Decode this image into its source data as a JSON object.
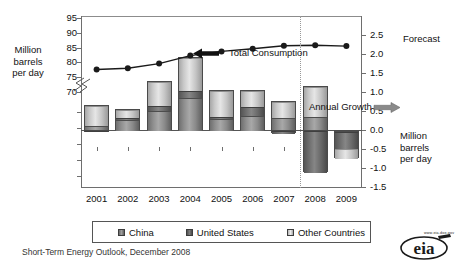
{
  "chart_data": {
    "type": "bar",
    "title": "",
    "subtitle": "",
    "categories": [
      "2001",
      "2002",
      "2003",
      "2004",
      "2005",
      "2006",
      "2007",
      "2008",
      "2009"
    ],
    "xlabel": "",
    "left_axis": {
      "label_lines": [
        "Million",
        "barrels",
        "per day"
      ],
      "ticks": [
        "70",
        "75",
        "80",
        "85",
        "90",
        "95"
      ],
      "ylim": [
        70,
        95
      ],
      "has_break": true
    },
    "right_axis": {
      "label_lines": [
        "Million",
        "barrels",
        "per day"
      ],
      "ticks": [
        "2.5",
        "2.0",
        "1.5",
        "1.0",
        "0.5",
        "0.0",
        "-0.5",
        "-1.0",
        "-1.5"
      ],
      "ylim": [
        -1.5,
        2.5
      ]
    },
    "series": [
      {
        "name": "China",
        "type": "bar-segment",
        "axis": "right",
        "values": [
          0.12,
          0.28,
          0.52,
          0.86,
          0.32,
          0.4,
          0.34,
          0.38,
          -0.03
        ]
      },
      {
        "name": "United States",
        "type": "bar-segment",
        "axis": "right",
        "values": [
          -0.02,
          0.05,
          0.14,
          0.18,
          0.06,
          0.22,
          -0.08,
          -1.1,
          -0.45
        ]
      },
      {
        "name": "Other Countries",
        "type": "bar-segment",
        "axis": "right",
        "values": [
          0.55,
          0.22,
          0.62,
          0.88,
          0.68,
          0.42,
          0.42,
          0.78,
          -0.25
        ]
      },
      {
        "name": "Total Consumption",
        "type": "line",
        "axis": "left",
        "values": [
          77.6,
          78.0,
          79.6,
          82.3,
          83.7,
          84.6,
          85.6,
          85.8,
          85.5
        ]
      }
    ],
    "annotations": [
      {
        "name": "total-consumption",
        "text": "Total Consumption",
        "arrow": "left"
      },
      {
        "name": "annual-growth",
        "text": "Annual Growth",
        "arrow": "right"
      },
      {
        "name": "forecast",
        "text": "Forecast",
        "arrow": "none",
        "divider_after_category": "2007"
      }
    ],
    "legend": {
      "position": "bottom",
      "entries": [
        {
          "label": "China",
          "swatch": "dark-gray"
        },
        {
          "label": "United States",
          "swatch": "medium-gray"
        },
        {
          "label": "Other Countries",
          "swatch": "light-gray"
        }
      ]
    },
    "grid": false
  },
  "axis_titles": {
    "left_line1": "Million",
    "left_line2": "barrels",
    "left_line3": "per day",
    "right_line1": "Million",
    "right_line2": "barrels",
    "right_line3": "per day"
  },
  "annotations": {
    "total_consumption": "Total Consumption",
    "annual_growth": "Annual Growth",
    "forecast": "Forecast"
  },
  "legend": {
    "china": "China",
    "united_states": "United States",
    "other_countries": "Other Countries"
  },
  "footer": {
    "source": "Short-Term Energy Outlook, December 2008",
    "logo_text": "eia",
    "logo_url": "www.eia.doe.gov"
  },
  "colors": {
    "china": "#8e8e8e",
    "united_states": "#5f5f5f",
    "other_countries": "#dcdcdc",
    "line": "#1a1a1a",
    "axis": "#6e6e6e",
    "forecast_divider": "#999999"
  }
}
